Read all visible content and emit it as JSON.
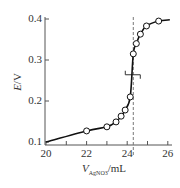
{
  "chart_data": {
    "type": "line",
    "title": "",
    "xlabel": "V_AgNO3/mL",
    "xlabel_main": "V",
    "xlabel_sub": "AgNO3",
    "xlabel_unit": "/mL",
    "ylabel": "E/V",
    "ylabel_main": "E",
    "ylabel_unit": "/V",
    "xlim": [
      20,
      26.2
    ],
    "ylim": [
      0.1,
      0.4
    ],
    "x_ticks": [
      20,
      21,
      22,
      23,
      24,
      25,
      26
    ],
    "x_tick_labels": [
      "20",
      "22",
      "24",
      "26"
    ],
    "y_ticks": [
      0.1,
      0.2,
      0.3,
      0.4
    ],
    "y_tick_labels": [
      "0.1",
      "0.2",
      "0.3",
      "0.4"
    ],
    "grid": false,
    "legend": null,
    "series": [
      {
        "name": "titration curve",
        "curve": [
          [
            20.0,
            0.1
          ],
          [
            22.0,
            0.127
          ],
          [
            23.0,
            0.137
          ],
          [
            23.45,
            0.149
          ],
          [
            23.7,
            0.163
          ],
          [
            23.9,
            0.178
          ],
          [
            24.15,
            0.21
          ],
          [
            24.3,
            0.315
          ],
          [
            24.45,
            0.34
          ],
          [
            24.65,
            0.363
          ],
          [
            24.95,
            0.383
          ],
          [
            25.55,
            0.395
          ],
          [
            26.1,
            0.398
          ]
        ],
        "markers": [
          [
            22.0,
            0.127
          ],
          [
            23.0,
            0.137
          ],
          [
            23.45,
            0.149
          ],
          [
            23.7,
            0.163
          ],
          [
            23.9,
            0.178
          ],
          [
            24.15,
            0.21
          ],
          [
            24.3,
            0.315
          ],
          [
            24.45,
            0.34
          ],
          [
            24.65,
            0.363
          ],
          [
            24.95,
            0.383
          ],
          [
            25.55,
            0.395
          ]
        ]
      }
    ],
    "annotations": [
      {
        "type": "vertical-dashed-line",
        "x": 24.3,
        "label": "equivalence point"
      },
      {
        "type": "tangent-marker",
        "x": 24.3,
        "y": 0.264
      }
    ]
  }
}
